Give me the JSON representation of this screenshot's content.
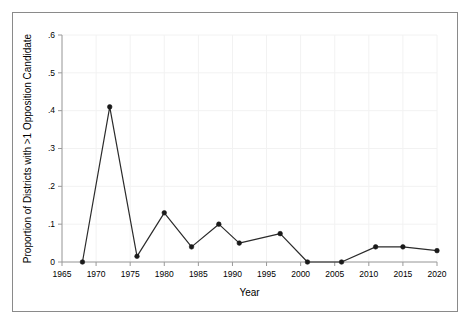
{
  "figure": {
    "background_color": "#ffffff",
    "frame_color": "#8a8a8a",
    "axis_color": "#9a9a9a",
    "grid_color": "#f2f2f2",
    "series_color": "#2b2b2b",
    "marker_color": "#1a1a1a"
  },
  "chart_data": {
    "type": "line",
    "title": "",
    "xlabel": "Year",
    "ylabel": "Proportion of Districts with >1 Opposition Candidate",
    "xlim": [
      1964,
      2022
    ],
    "ylim": [
      0,
      0.6
    ],
    "grid": true,
    "legend": "none",
    "markers": "filled-circle",
    "xticks": [
      1965,
      1970,
      1975,
      1980,
      1985,
      1990,
      1995,
      2000,
      2005,
      2010,
      2015,
      2020
    ],
    "xtick_labels": [
      "1965",
      "1970",
      "1975",
      "1980",
      "1985",
      "1990",
      "1995",
      "2000",
      "2005",
      "2010",
      "2015",
      "2020"
    ],
    "yticks": [
      0,
      0.1,
      0.2,
      0.3,
      0.4,
      0.5,
      0.6
    ],
    "ytick_labels": [
      "0",
      ".1",
      ".2",
      ".3",
      ".4",
      ".5",
      ".6"
    ],
    "x": [
      1968,
      1972,
      1976,
      1980,
      1984,
      1988,
      1991,
      1997,
      2001,
      2006,
      2011,
      2015,
      2020
    ],
    "y": [
      0.0,
      0.41,
      0.015,
      0.13,
      0.04,
      0.1,
      0.05,
      0.075,
      0.0,
      0.0,
      0.04,
      0.04,
      0.03
    ],
    "points": [
      {
        "x": 1968,
        "y": 0.0
      },
      {
        "x": 1972,
        "y": 0.41
      },
      {
        "x": 1976,
        "y": 0.015
      },
      {
        "x": 1980,
        "y": 0.13
      },
      {
        "x": 1984,
        "y": 0.04
      },
      {
        "x": 1988,
        "y": 0.1
      },
      {
        "x": 1991,
        "y": 0.05
      },
      {
        "x": 1997,
        "y": 0.075
      },
      {
        "x": 2001,
        "y": 0.0
      },
      {
        "x": 2006,
        "y": 0.0
      },
      {
        "x": 2011,
        "y": 0.04
      },
      {
        "x": 2015,
        "y": 0.04
      },
      {
        "x": 2020,
        "y": 0.03
      }
    ]
  }
}
